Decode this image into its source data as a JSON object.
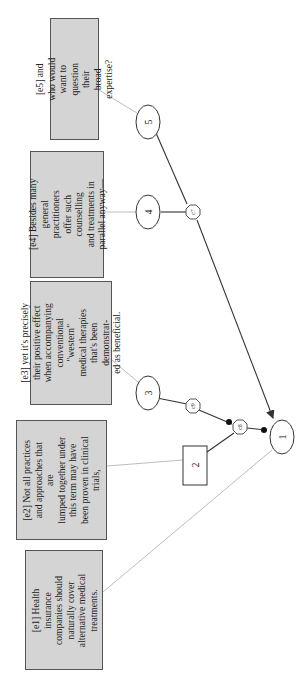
{
  "diagram": {
    "orientation": "rotated-90-ccw",
    "colors": {
      "box_fill": "#d4d4d4",
      "box_border": "#555555",
      "link_gray": "#bdbdbd",
      "edge": "#333333"
    },
    "evidence": [
      {
        "id": "e1",
        "text": "[e1] Health insurance\ncompanies should\nnaturally cover\nalternative medical\ntreatments."
      },
      {
        "id": "e2",
        "text": "[e2] Not all practices\nand approaches that are\nlumped together under\nthis term may have\nbeen proven in clinical\ntrials,"
      },
      {
        "id": "e3",
        "text": "[e3] yet it's precisely\ntheir positive effect\nwhen accompanying\nconventional \"western\"\nmedical therapies\nthat's been demonstrat-\ned as beneficial."
      },
      {
        "id": "e4",
        "text": "[e4] Besides many\ngeneral practitioners\noffer such counselling\nand treatments in\nparallel anyway—"
      },
      {
        "id": "e5",
        "text": "[e5] and who would\nwant to question their\nbroad expertise?"
      }
    ],
    "nodes": [
      {
        "id": "1",
        "label": "1",
        "shape": "ellipse"
      },
      {
        "id": "2",
        "label": "2",
        "shape": "box"
      },
      {
        "id": "3",
        "label": "3",
        "shape": "ellipse"
      },
      {
        "id": "4",
        "label": "4",
        "shape": "ellipse"
      },
      {
        "id": "5",
        "label": "5",
        "shape": "ellipse"
      },
      {
        "id": "c6",
        "label": "c6",
        "shape": "octagon"
      },
      {
        "id": "c7",
        "label": "c7",
        "shape": "octagon"
      },
      {
        "id": "c8",
        "label": "c8",
        "shape": "octagon"
      },
      {
        "id": "c9",
        "label": "c9",
        "shape": "octagon"
      }
    ],
    "edges": [
      {
        "from": "5",
        "to": "1",
        "via": "c7",
        "type": "support",
        "arrow": "filled-arrow"
      },
      {
        "from": "4",
        "to": "c7",
        "type": "linked-premise"
      },
      {
        "from": "2",
        "to": "c8",
        "type": "attack"
      },
      {
        "from": "c8",
        "to": "1",
        "type": "attack",
        "arrow": "dot"
      },
      {
        "from": "3",
        "to": "c9",
        "type": "counter"
      },
      {
        "from": "c9",
        "to": "c8",
        "type": "attack",
        "arrow": "dot"
      }
    ]
  }
}
